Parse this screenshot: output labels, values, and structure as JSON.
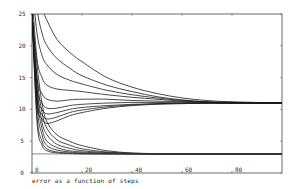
{
  "chart_data": {
    "type": "line",
    "title": "",
    "caption": "error as a function of steps",
    "xlabel": "",
    "ylabel": "",
    "xlim": [
      0,
      100
    ],
    "ylim": [
      0,
      25
    ],
    "x_ticks": [
      0,
      20,
      40,
      60,
      80
    ],
    "y_ticks": [
      0,
      5,
      10,
      15,
      20,
      25
    ],
    "grid": false,
    "legend": null,
    "line_color": "#1a1a1a",
    "series_groups": [
      {
        "name": "upper family (converges to ~11)",
        "asymptote": 11,
        "series": [
          {
            "name": "u1",
            "x": [
              0,
              2,
              4,
              6,
              10,
              15,
              20,
              30,
              40,
              50,
              60,
              70,
              80,
              100
            ],
            "y": [
              40,
              30,
              26,
              24,
              21,
              19,
              17.5,
              15,
              13.5,
              12.5,
              11.8,
              11.4,
              11.2,
              11
            ]
          },
          {
            "name": "u2",
            "x": [
              0,
              2,
              4,
              6,
              10,
              15,
              20,
              30,
              40,
              50,
              60,
              70,
              80,
              100
            ],
            "y": [
              35,
              26,
              22,
              20,
              18,
              16.5,
              15.3,
              13.8,
              12.8,
              12,
              11.5,
              11.2,
              11.1,
              11
            ]
          },
          {
            "name": "u3",
            "x": [
              0,
              2,
              4,
              6,
              10,
              15,
              20,
              30,
              40,
              50,
              60,
              70,
              80,
              100
            ],
            "y": [
              30,
              22,
              18.5,
              17,
              15.5,
              14.6,
              14,
              13,
              12.3,
              11.8,
              11.4,
              11.2,
              11.1,
              11
            ]
          },
          {
            "name": "u4",
            "x": [
              0,
              2,
              4,
              6,
              10,
              15,
              20,
              30,
              40,
              50,
              60,
              70,
              80,
              100
            ],
            "y": [
              28,
              18,
              15,
              13.8,
              13.2,
              13,
              12.8,
              12.3,
              11.9,
              11.6,
              11.3,
              11.1,
              11,
              11
            ]
          },
          {
            "name": "u5",
            "x": [
              0,
              2,
              4,
              6,
              10,
              15,
              20,
              30,
              40,
              50,
              60,
              70,
              80,
              100
            ],
            "y": [
              26,
              15,
              12.5,
              11.6,
              11.3,
              11.5,
              11.6,
              11.6,
              11.4,
              11.3,
              11.2,
              11.1,
              11,
              11
            ]
          },
          {
            "name": "u6",
            "x": [
              0,
              2,
              4,
              6,
              10,
              15,
              20,
              30,
              40,
              50,
              60,
              70,
              80,
              100
            ],
            "y": [
              25,
              13.5,
              11,
              10.2,
              10.2,
              10.6,
              10.8,
              11,
              11.1,
              11.1,
              11,
              11,
              11,
              11
            ]
          },
          {
            "name": "u7",
            "x": [
              0,
              2,
              4,
              6,
              10,
              15,
              20,
              30,
              40,
              50,
              60,
              70,
              80,
              100
            ],
            "y": [
              25,
              12.5,
              10,
              9.3,
              9.5,
              10,
              10.3,
              10.6,
              10.8,
              10.9,
              11,
              11,
              11,
              11
            ]
          },
          {
            "name": "u8",
            "x": [
              0,
              2,
              4,
              6,
              10,
              15,
              20,
              30,
              40,
              50,
              60,
              70,
              80,
              100
            ],
            "y": [
              25,
              11.5,
              9.2,
              8.5,
              8.8,
              9.5,
              9.9,
              10.4,
              10.7,
              10.9,
              11,
              11,
              11,
              11
            ]
          },
          {
            "name": "u9",
            "x": [
              0,
              2,
              4,
              6,
              10,
              15,
              20,
              30,
              40,
              50,
              60,
              70,
              80,
              100
            ],
            "y": [
              25,
              11,
              8.5,
              7.8,
              8.2,
              9,
              9.5,
              10.2,
              10.6,
              10.8,
              10.9,
              11,
              11,
              11
            ]
          }
        ]
      },
      {
        "name": "lower family (converges to ~3)",
        "asymptote": 3,
        "series": [
          {
            "name": "l1",
            "x": [
              0,
              2,
              4,
              6,
              10,
              15,
              20,
              30,
              40,
              50,
              60,
              100
            ],
            "y": [
              25,
              17,
              11,
              8,
              6,
              5,
              4.3,
              3.5,
              3.15,
              3.05,
              3,
              3
            ]
          },
          {
            "name": "l2",
            "x": [
              0,
              2,
              4,
              6,
              10,
              15,
              20,
              30,
              40,
              50,
              60,
              100
            ],
            "y": [
              25,
              15,
              9.5,
              7,
              5.2,
              4.4,
              3.8,
              3.3,
              3.1,
              3,
              3,
              3
            ]
          },
          {
            "name": "l3",
            "x": [
              0,
              2,
              4,
              6,
              10,
              15,
              20,
              30,
              40,
              50,
              60,
              100
            ],
            "y": [
              25,
              13.5,
              8,
              6,
              4.5,
              3.9,
              3.5,
              3.2,
              3.05,
              3,
              3,
              3
            ]
          },
          {
            "name": "l4",
            "x": [
              0,
              2,
              4,
              6,
              10,
              15,
              20,
              30,
              40,
              50,
              60,
              100
            ],
            "y": [
              25,
              12,
              7,
              5,
              4,
              3.5,
              3.3,
              3.1,
              3,
              3,
              3,
              3
            ]
          },
          {
            "name": "l5",
            "x": [
              0,
              2,
              4,
              6,
              10,
              15,
              20,
              30,
              40,
              50,
              60,
              100
            ],
            "y": [
              25,
              10.5,
              6,
              4.3,
              3.6,
              3.3,
              3.15,
              3.05,
              3,
              3,
              3,
              3
            ]
          },
          {
            "name": "l6",
            "x": [
              0,
              2,
              4,
              6,
              10,
              15,
              20,
              30,
              40,
              50,
              60,
              100
            ],
            "y": [
              25,
              9,
              5,
              3.8,
              3.3,
              3.15,
              3.05,
              3,
              3,
              3,
              3,
              3
            ]
          },
          {
            "name": "l7",
            "x": [
              0,
              2,
              4,
              6,
              10,
              15,
              20,
              30,
              40,
              50,
              60,
              100
            ],
            "y": [
              25,
              8,
              4.4,
              3.5,
              3.15,
              3.05,
              3,
              3,
              3,
              3,
              3,
              3
            ]
          }
        ]
      }
    ],
    "reference_line": {
      "y": 3,
      "x_range": [
        0,
        100
      ]
    }
  }
}
